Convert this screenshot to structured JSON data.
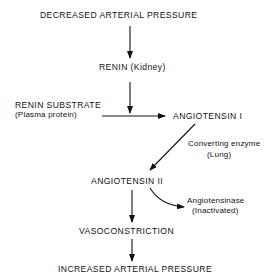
{
  "diagram": {
    "nodes": {
      "decreased_pressure": "DECREASED ARTERIAL PRESSURE",
      "renin": "RENIN (Kidney)",
      "renin_substrate": "RENIN SUBSTRATE",
      "renin_substrate_note": "(Plasma protein)",
      "angiotensin_1": "ANGIOTENSIN I",
      "converting_enzyme": "Converting enzyme",
      "converting_enzyme_note": "(Lung)",
      "angiotensin_2": "ANGIOTENSIN II",
      "angiotensinase": "Angiotensinase",
      "angiotensinase_note": "(Inactivated)",
      "vasoconstriction": "VASOCONSTRICTION",
      "increased_pressure": "INCREASED ARTERIAL PRESSURE"
    },
    "edges": [
      {
        "from": "decreased_pressure",
        "to": "renin"
      },
      {
        "from": "renin",
        "to": "substrate_to_angiotensin_1_arrow"
      },
      {
        "from": "renin_substrate",
        "to": "angiotensin_1"
      },
      {
        "from": "angiotensin_1",
        "to": "angiotensin_2",
        "label": "converting_enzyme"
      },
      {
        "from": "angiotensin_2",
        "to": "angiotensinase"
      },
      {
        "from": "angiotensin_2",
        "to": "vasoconstriction"
      },
      {
        "from": "vasoconstriction",
        "to": "increased_pressure"
      }
    ],
    "colors": {
      "ink": "#111111",
      "background": "#ffffff"
    }
  }
}
